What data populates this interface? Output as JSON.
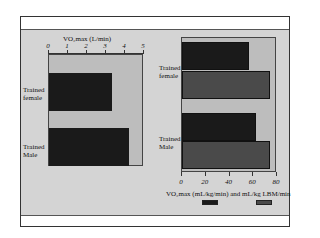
{
  "chart_data": [
    {
      "type": "bar",
      "orientation": "horizontal",
      "title": "",
      "xlabel": "VO2max (L/min)",
      "xlabel_position": "top",
      "ylabel": "",
      "categories": [
        "Trained female",
        "Trained Male"
      ],
      "values": [
        3.4,
        4.3
      ],
      "xlim": [
        0,
        5
      ],
      "xticks": [
        "0",
        "1",
        "2",
        "3",
        "4",
        "5"
      ],
      "bar_color": "#1a1a1a",
      "grid": false
    },
    {
      "type": "bar",
      "orientation": "horizontal",
      "title": "",
      "xlabel": "VO2max (mL/kg/min) and mL/kg LBM/min",
      "xlabel_position": "bottom",
      "ylabel": "",
      "categories": [
        "Trained female",
        "Trained Male"
      ],
      "series": [
        {
          "name": "VO2max (mL/kg/min)",
          "values": [
            58,
            64
          ],
          "color": "#1a1a1a"
        },
        {
          "name": "mL/kg LBM/min",
          "values": [
            76,
            76
          ],
          "color": "#4a4a4a"
        }
      ],
      "xlim": [
        0,
        80
      ],
      "xticks": [
        "0",
        "20",
        "40",
        "60",
        "80"
      ],
      "legend_position": "bottom",
      "grid": false
    }
  ],
  "left": {
    "axis_title": "VO₂max (L/min)",
    "ticks": [
      "0",
      "1",
      "2",
      "3",
      "4",
      "5"
    ],
    "cat_female_1": "Trained",
    "cat_female_2": "female",
    "cat_male_1": "Trained",
    "cat_male_2": "Male"
  },
  "right": {
    "axis_title": "VO₂max (mL/kg/min) and mL/kg LBM/min",
    "ticks": [
      "0",
      "20",
      "40",
      "60",
      "80"
    ],
    "cat_female_1": "Trained",
    "cat_female_2": "female",
    "cat_male_1": "Trained",
    "cat_male_2": "Male"
  }
}
